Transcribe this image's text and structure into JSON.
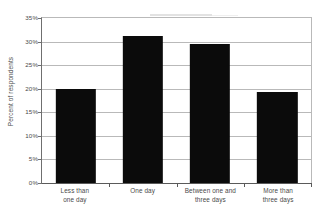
{
  "chart_data": {
    "type": "bar",
    "title": "",
    "xlabel": "",
    "ylabel": "Percent of respondents",
    "categories": [
      "Less than one day",
      "One day",
      "Between one and three days",
      "More than three days"
    ],
    "category_lines": [
      [
        "Less than",
        "one day"
      ],
      [
        "One day",
        ""
      ],
      [
        "Between one and",
        "three days"
      ],
      [
        "More than",
        "three days"
      ]
    ],
    "values": [
      19.9,
      31.2,
      29.4,
      19.4
    ],
    "value_labels": [
      "19.9%",
      "31.2%",
      "29.4%",
      "19.4%"
    ],
    "ylim": [
      0,
      35
    ],
    "ytick_values": [
      0,
      5,
      10,
      15,
      20,
      25,
      30,
      35
    ],
    "ytick_labels": [
      "0%",
      "5%",
      "10%",
      "15%",
      "20%",
      "25%",
      "30%",
      "35%"
    ],
    "grid": true,
    "grid_orientation": "horizontal",
    "legend": false,
    "legend_position": "none",
    "bar_color": "#0b0b0b",
    "grid_color": "#b9b9b9",
    "axis_color": "#5a5a5a",
    "background_color": "#ffffff",
    "text_color": "#4a4a4a"
  }
}
